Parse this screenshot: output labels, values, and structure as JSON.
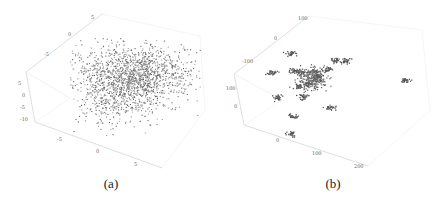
{
  "figure": {
    "panels": [
      {
        "id": "a",
        "caption": "(a)"
      },
      {
        "id": "b",
        "caption": "(b)"
      }
    ]
  },
  "chart_data": [
    {
      "type": "scatter",
      "subtype": "3d",
      "title": "(a)",
      "description": "Dense 3D point cloud of several thousand gray points",
      "axes": {
        "top_axis_ticks": [
          "-5",
          "0",
          "5"
        ],
        "vertical_axis_ticks": [
          "5",
          "0",
          "-5",
          "-10"
        ],
        "bottom_axis_ticks": [
          "-5",
          "0",
          "5"
        ]
      },
      "point_color": "#6e6e6e",
      "approx_point_count": 2500,
      "grid": false
    },
    {
      "type": "scatter",
      "subtype": "3d",
      "title": "(b)",
      "description": "Sparse set of tight point clusters around a dense central cluster",
      "axes": {
        "top_axis_ticks": [
          "-100",
          "0",
          "100"
        ],
        "vertical_axis_ticks": [
          "100",
          "0"
        ],
        "bottom_axis_ticks": [
          "0",
          "100",
          "200"
        ]
      },
      "point_color": "#555555",
      "approx_cluster_count": 17,
      "grid": false
    }
  ],
  "labels": {
    "a": {
      "top": [
        "-5",
        "0",
        "5"
      ],
      "left": [
        "5",
        "0",
        "-5",
        "-10"
      ],
      "bottom": [
        "-5",
        "0",
        "5"
      ]
    },
    "b": {
      "top": [
        "-100",
        "0",
        "100"
      ],
      "left": [
        "100",
        "0"
      ],
      "bottom": [
        "0",
        "100",
        "200"
      ]
    }
  }
}
